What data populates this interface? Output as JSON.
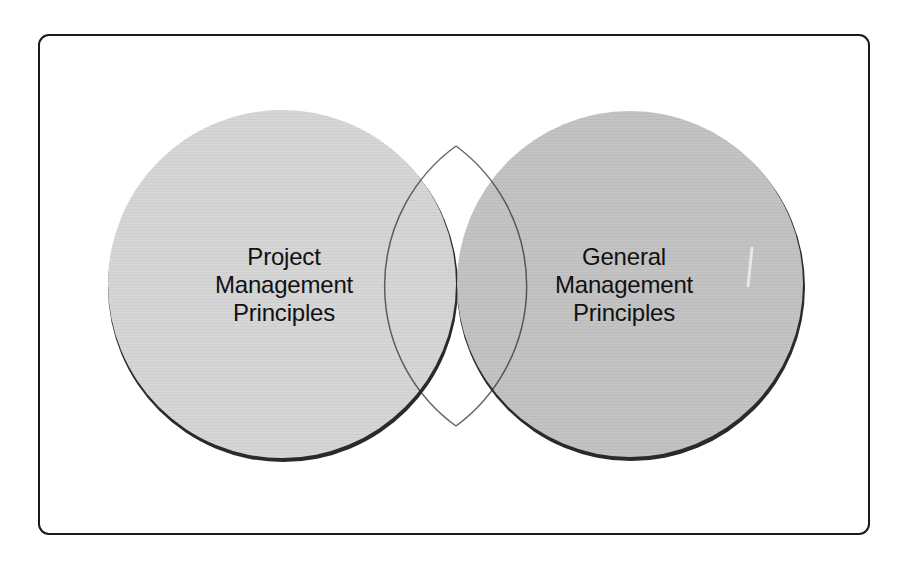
{
  "diagram": {
    "type": "venn",
    "sets": [
      {
        "id": "left",
        "label_lines": [
          "Project",
          "Management",
          "Principles"
        ],
        "label": "Project Management Principles",
        "color": "#d6d6d6"
      },
      {
        "id": "right",
        "label_lines": [
          "General",
          "Management",
          "Principles"
        ],
        "label": "General Management Principles",
        "color": "#c3c3c3"
      }
    ],
    "intersection": {
      "label": "",
      "color": "#7c7c7c"
    },
    "frame_border_color": "#1a1a1a",
    "outline_color": "#222222"
  }
}
